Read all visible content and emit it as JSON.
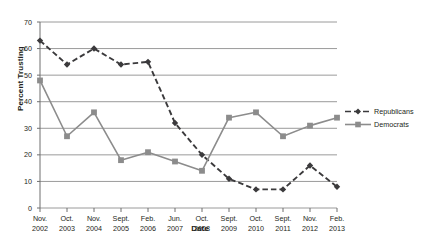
{
  "chart_data": {
    "type": "line",
    "title": "",
    "xlabel": "Date",
    "ylabel": "Percent Trusting",
    "categories": [
      "Nov. 2002",
      "Oct. 2003",
      "Nov. 2004",
      "Sept. 2005",
      "Feb. 2006",
      "Jun. 2007",
      "Oct. 2008",
      "Sept. 2009",
      "Oct. 2010",
      "Sept. 2011",
      "Nov. 2012",
      "Feb. 2013"
    ],
    "category_lines": [
      [
        "Nov.",
        "2002"
      ],
      [
        "Oct.",
        "2003"
      ],
      [
        "Nov.",
        "2004"
      ],
      [
        "Sept.",
        "2005"
      ],
      [
        "Feb.",
        "2006"
      ],
      [
        "Jun.",
        "2007"
      ],
      [
        "Oct.",
        "2008"
      ],
      [
        "Sept.",
        "2009"
      ],
      [
        "Oct.",
        "2010"
      ],
      [
        "Sept.",
        "2011"
      ],
      [
        "Nov.",
        "2012"
      ],
      [
        "Feb.",
        "2013"
      ]
    ],
    "ylim": [
      0,
      70
    ],
    "yticks": [
      0,
      10,
      20,
      30,
      40,
      50,
      60,
      70
    ],
    "ytick_labels": [
      "0",
      "10",
      "20",
      "30",
      "40",
      "50",
      "60",
      "70"
    ],
    "grid": true,
    "legend_position": "right",
    "series": [
      {
        "name": "Republicans",
        "color": "#3b3a3c",
        "style": "dashed",
        "marker": "diamond",
        "values": [
          63,
          54,
          60,
          54,
          55,
          32,
          20,
          11,
          7,
          7,
          16,
          8
        ]
      },
      {
        "name": "Democrats",
        "color": "#8c8c8c",
        "style": "solid",
        "marker": "square",
        "values": [
          48,
          27,
          36,
          18,
          21,
          17.5,
          14,
          34,
          36,
          27,
          31,
          34
        ]
      }
    ]
  },
  "legend": {
    "items": [
      {
        "label": "Republicans"
      },
      {
        "label": "Democrats"
      }
    ]
  }
}
